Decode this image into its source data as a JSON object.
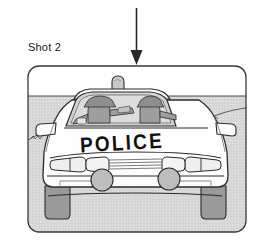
{
  "figure": {
    "shot_label": "Shot 2",
    "arrow": {
      "name": "down-arrow",
      "direction": "down",
      "x": 136,
      "top_y": 8,
      "tip_y": 64
    },
    "panel": {
      "name": "illustration-frame",
      "x": 28,
      "y": 66,
      "width": 218,
      "height": 166,
      "corner_radius": 11,
      "border_color": "#3a3a3a",
      "sky_color": "#ffffff",
      "ground_color": "#d8d8d8",
      "horizon_y": 96
    },
    "scene": {
      "title": "Police car front view on road",
      "vehicle": {
        "name": "police-car",
        "body_color": "#fdfdfd",
        "outline_color": "#2b2b2b",
        "glass_color": "#d2d2d2",
        "tire_color": "#909090",
        "hood_text": "POLICE",
        "roof_light": {
          "name": "roof-light-bar",
          "x": 118,
          "y": 80,
          "color": "#c9c9c9"
        },
        "headlights": 4,
        "fog_lights": 2,
        "occupants": [
          {
            "name": "driver-officer",
            "cap": "peaked-cap",
            "side": "left"
          },
          {
            "name": "passenger-officer",
            "cap": "peaked-cap",
            "side": "right"
          }
        ]
      },
      "road_edge": {
        "name": "road-edge-line",
        "color": "#555555"
      }
    }
  }
}
